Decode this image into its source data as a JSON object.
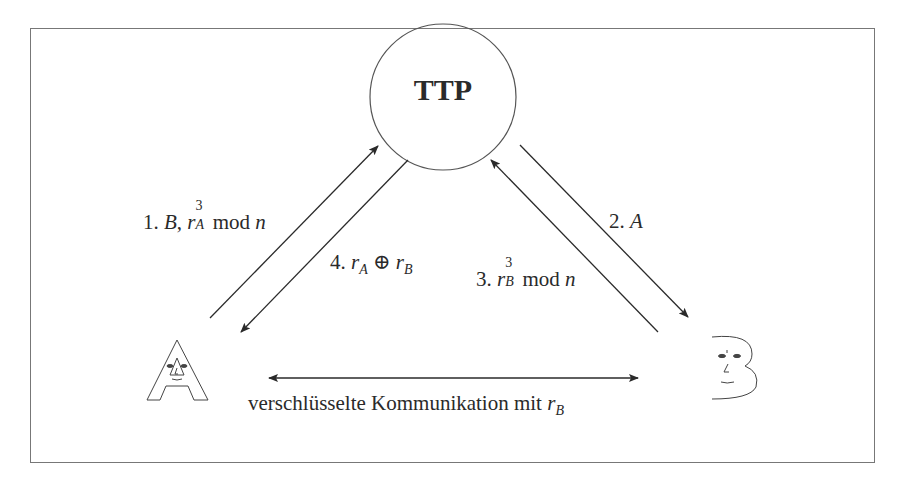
{
  "diagram": {
    "nodes": {
      "ttp": {
        "label": "TTP"
      },
      "alice": {
        "label": "A",
        "glyph": "face-letter-A"
      },
      "bob": {
        "label": "B",
        "glyph": "face-letter-B"
      }
    },
    "edges": [
      {
        "step": "1.",
        "from": "A",
        "to": "TTP",
        "label_parts": {
          "num": "1.",
          "party": "B",
          "comma": ",",
          "var": "r",
          "sup": "3",
          "sub": "A",
          "mod": "mod",
          "n": "n"
        }
      },
      {
        "step": "2.",
        "from": "TTP",
        "to": "B",
        "label_parts": {
          "num": "2.",
          "party": "A"
        }
      },
      {
        "step": "3.",
        "from": "B",
        "to": "TTP",
        "label_parts": {
          "num": "3.",
          "var": "r",
          "sup": "3",
          "sub": "B",
          "mod": "mod",
          "n": "n"
        }
      },
      {
        "step": "4.",
        "from": "TTP",
        "to": "A",
        "label_parts": {
          "num": "4.",
          "var1": "r",
          "sub1": "A",
          "op": "⊕",
          "var2": "r",
          "sub2": "B"
        }
      }
    ],
    "bottom": {
      "text": "verschlüsselte Kommunikation mit",
      "var": "r",
      "sub": "B",
      "direction": "bidirectional"
    },
    "colors": {
      "line": "#2a2a2a",
      "frame": "#777777",
      "background": "#ffffff"
    }
  }
}
